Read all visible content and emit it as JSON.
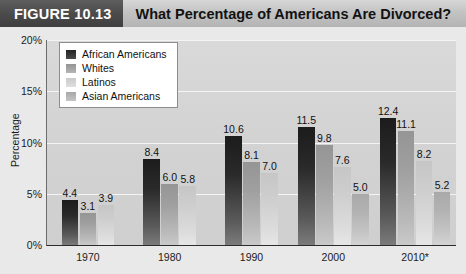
{
  "header": {
    "figure_label": "FIGURE 10.13",
    "title": "What Percentage of Americans Are Divorced?"
  },
  "chart_data": {
    "type": "bar",
    "title": "What Percentage of Americans Are Divorced?",
    "xlabel": "",
    "ylabel": "Percentage",
    "ylim": [
      0,
      20
    ],
    "yticks": [
      "0%",
      "5%",
      "10%",
      "15%",
      "20%"
    ],
    "ytick_values": [
      0,
      5,
      10,
      15,
      20
    ],
    "grid": true,
    "legend_position": "top-left",
    "categories": [
      "1970",
      "1980",
      "1990",
      "2000",
      "2010*"
    ],
    "series": [
      {
        "name": "African Americans",
        "color": "#232323",
        "values": [
          4.4,
          8.4,
          10.6,
          11.5,
          12.4
        ],
        "labels": [
          "4.4",
          "8.4",
          "10.6",
          "11.5",
          "12.4"
        ]
      },
      {
        "name": "Whites",
        "color": "#949494",
        "values": [
          3.1,
          6.0,
          8.1,
          9.8,
          11.1
        ],
        "labels": [
          "3.1",
          "6.0",
          "8.1",
          "9.8",
          "11.1"
        ]
      },
      {
        "name": "Latinos",
        "color": "#c9c9c9",
        "values": [
          3.9,
          5.8,
          7.0,
          7.6,
          8.2
        ],
        "labels": [
          "3.9",
          "5.8",
          "7.0",
          "7.6",
          "8.2"
        ]
      },
      {
        "name": "Asian Americans",
        "color": "#a8a8a8",
        "values": [
          null,
          null,
          null,
          5.0,
          5.2
        ],
        "labels": [
          "",
          "",
          "",
          "5.0",
          "5.2"
        ]
      }
    ]
  }
}
